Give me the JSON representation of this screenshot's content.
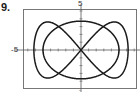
{
  "problem": {
    "number": "9."
  },
  "chart_data": {
    "type": "line",
    "title": "",
    "xlabel": "",
    "ylabel": "",
    "tick_labels": {
      "y_top": "5",
      "x_left": "-5",
      "y_bottom": "-"
    },
    "xlim": [
      -6,
      6
    ],
    "ylim": [
      -5,
      5
    ],
    "grid": false,
    "legend": null,
    "series": [
      {
        "name": "ellipse",
        "kind": "parametric",
        "x": "5cos(t)",
        "y": "3.7sin(t)",
        "t_range": [
          0,
          6.2832
        ]
      },
      {
        "name": "figure-eight",
        "kind": "parametric",
        "x": "6sin(t)",
        "y": "3.6sin(2t)",
        "t_range": [
          0,
          6.2832
        ]
      }
    ],
    "intersections_on_x_axis": [
      -5,
      0,
      5
    ],
    "colors": {
      "curve": "#1a1a1a",
      "axes": "#555555",
      "frame": "#777777"
    }
  }
}
